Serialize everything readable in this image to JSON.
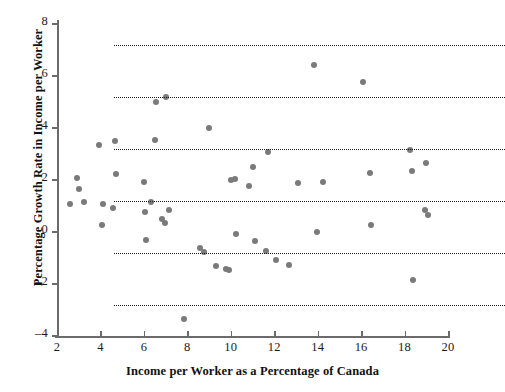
{
  "chart_data": {
    "type": "scatter",
    "title": "",
    "xlabel": "Income per Worker as a Percentage of Canada",
    "ylabel": "Percentage Growth Rate in Income per Worker",
    "xlim": [
      2,
      20
    ],
    "ylim": [
      -4,
      8
    ],
    "xticks": [
      2,
      4,
      6,
      8,
      10,
      12,
      14,
      16,
      18,
      20
    ],
    "yticks": [
      -4,
      -2,
      0,
      2,
      4,
      6,
      8
    ],
    "grid": "horizontal-dotted-at-yticks",
    "legend": "none",
    "marker_color": "#7a7a7a",
    "points": [
      {
        "x": 2.6,
        "y": 1.05
      },
      {
        "x": 2.9,
        "y": 2.05
      },
      {
        "x": 3.0,
        "y": 1.6
      },
      {
        "x": 3.25,
        "y": 1.1
      },
      {
        "x": 3.95,
        "y": 3.3
      },
      {
        "x": 4.1,
        "y": 1.05
      },
      {
        "x": 4.05,
        "y": 0.25
      },
      {
        "x": 4.65,
        "y": 3.45
      },
      {
        "x": 4.7,
        "y": 2.2
      },
      {
        "x": 4.6,
        "y": 0.9
      },
      {
        "x": 6.0,
        "y": 1.9
      },
      {
        "x": 6.05,
        "y": 0.75
      },
      {
        "x": 6.1,
        "y": -0.35
      },
      {
        "x": 6.35,
        "y": 1.1
      },
      {
        "x": 6.5,
        "y": 3.5
      },
      {
        "x": 6.55,
        "y": 4.95
      },
      {
        "x": 6.85,
        "y": 0.45
      },
      {
        "x": 6.95,
        "y": 0.3
      },
      {
        "x": 7.0,
        "y": 5.15
      },
      {
        "x": 7.15,
        "y": 0.8
      },
      {
        "x": 7.85,
        "y": -3.4
      },
      {
        "x": 8.6,
        "y": -0.65
      },
      {
        "x": 8.75,
        "y": -0.8
      },
      {
        "x": 9.0,
        "y": 3.95
      },
      {
        "x": 9.3,
        "y": -1.35
      },
      {
        "x": 9.8,
        "y": -1.45
      },
      {
        "x": 9.9,
        "y": -1.5
      },
      {
        "x": 10.0,
        "y": 1.95
      },
      {
        "x": 10.2,
        "y": 2.0
      },
      {
        "x": 10.25,
        "y": -0.1
      },
      {
        "x": 10.85,
        "y": 1.75
      },
      {
        "x": 11.0,
        "y": 2.45
      },
      {
        "x": 11.1,
        "y": -0.4
      },
      {
        "x": 11.6,
        "y": -0.75
      },
      {
        "x": 11.7,
        "y": 3.05
      },
      {
        "x": 12.1,
        "y": -1.1
      },
      {
        "x": 12.7,
        "y": -1.3
      },
      {
        "x": 13.1,
        "y": 1.85
      },
      {
        "x": 13.85,
        "y": 6.4
      },
      {
        "x": 13.95,
        "y": -0.05
      },
      {
        "x": 14.25,
        "y": 1.9
      },
      {
        "x": 16.1,
        "y": 5.75
      },
      {
        "x": 16.4,
        "y": 2.25
      },
      {
        "x": 16.45,
        "y": 0.25
      },
      {
        "x": 18.25,
        "y": 3.1
      },
      {
        "x": 18.35,
        "y": 2.3
      },
      {
        "x": 18.4,
        "y": -1.9
      },
      {
        "x": 18.95,
        "y": 0.8
      },
      {
        "x": 19.0,
        "y": 2.6
      },
      {
        "x": 19.1,
        "y": 0.6
      }
    ]
  }
}
